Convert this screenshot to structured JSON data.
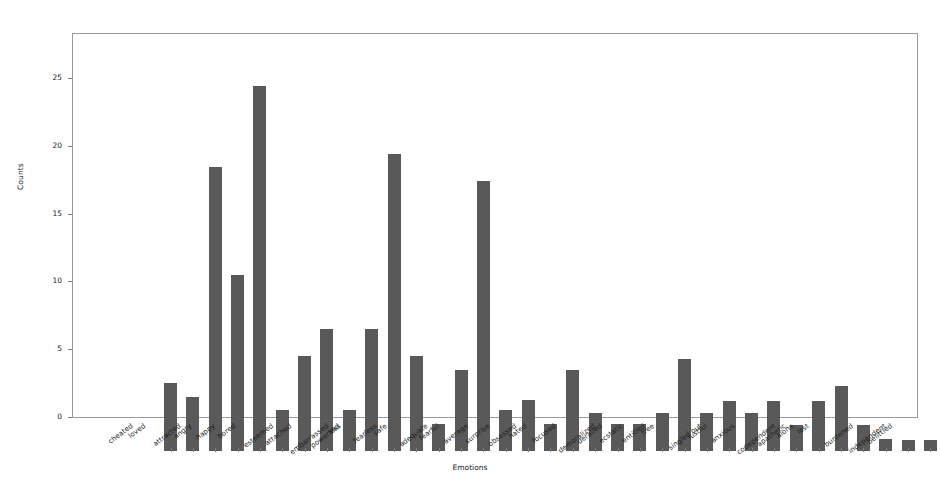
{
  "chart_data": {
    "type": "bar",
    "title": "",
    "xlabel": "Emotions",
    "ylabel": "Counts",
    "ylim": [
      0,
      28.4
    ],
    "yticks": [
      0,
      5,
      10,
      15,
      20,
      25
    ],
    "ytick_labels": [
      "0",
      "5",
      "10",
      "15",
      "20",
      "25"
    ],
    "grid": false,
    "legend": false,
    "bar_color": "#595959",
    "categories": [
      "cheated",
      "loved",
      "attracted",
      "angry",
      "happy",
      "bored",
      "esteemed",
      "attached",
      "embarrassed",
      "powerless",
      "sad",
      "fearless",
      "safe",
      "adequate",
      "fearful",
      "average",
      "surprise",
      "obsessed",
      "hated",
      "focused",
      "demoralized",
      "derailed",
      "ecstatic",
      "entitled",
      "free",
      "singled out",
      "lustful",
      "anxious",
      "codependent",
      "apathetic",
      "alone",
      "lost",
      "burdened",
      "independent",
      "belittled"
    ],
    "values": [
      5,
      4,
      21,
      13,
      27,
      3,
      7,
      9,
      3,
      9,
      22,
      7,
      2,
      6,
      20,
      3,
      3.8,
      2,
      6,
      2.8,
      2,
      2,
      2.8,
      6.8,
      2.8,
      3.7,
      2.8,
      3.7,
      1.9,
      3.7,
      4.8,
      1.9,
      0.9,
      0.8,
      0.8
    ]
  }
}
